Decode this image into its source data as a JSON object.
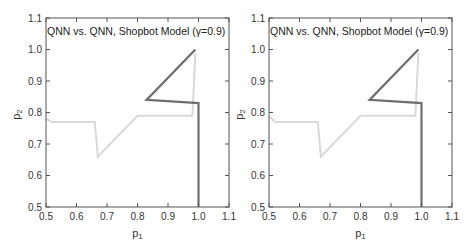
{
  "chart_data": [
    {
      "type": "line",
      "title": "QNN vs. QNN, Shopbot Model (γ=0.9)",
      "xlabel": "p1",
      "ylabel": "p2",
      "xlim": [
        0.5,
        1.1
      ],
      "ylim": [
        0.5,
        1.1
      ],
      "xticks": [
        "0.5",
        "0.6",
        "0.7",
        "0.8",
        "0.9",
        "1.0",
        "1.1"
      ],
      "yticks": [
        "0.5",
        "0.6",
        "0.7",
        "0.8",
        "0.9",
        "1.0",
        "1.1"
      ],
      "grid": false,
      "legend": null,
      "series": [
        {
          "name": "dark trajectory",
          "color": "#6e6e6e",
          "points": [
            [
              1.0,
              0.5
            ],
            [
              1.0,
              0.83
            ],
            [
              0.83,
              0.84
            ],
            [
              0.99,
              1.0
            ]
          ]
        },
        {
          "name": "light trajectory",
          "color": "#d9d9d9",
          "points": [
            [
              0.5,
              0.78
            ],
            [
              0.52,
              0.77
            ],
            [
              0.66,
              0.77
            ],
            [
              0.67,
              0.66
            ],
            [
              0.8,
              0.79
            ],
            [
              0.98,
              0.79
            ],
            [
              0.99,
              0.99
            ]
          ]
        }
      ]
    },
    {
      "type": "line",
      "title": "QNN vs. QNN, Shopbot Model (γ=0.9)",
      "xlabel": "p1",
      "ylabel": "p2",
      "xlim": [
        0.5,
        1.1
      ],
      "ylim": [
        0.5,
        1.1
      ],
      "xticks": [
        "0.5",
        "0.6",
        "0.7",
        "0.8",
        "0.9",
        "1.0",
        "1.1"
      ],
      "yticks": [
        "0.5",
        "0.6",
        "0.7",
        "0.8",
        "0.9",
        "1.0",
        "1.1"
      ],
      "grid": false,
      "legend": null,
      "series": [
        {
          "name": "dark trajectory",
          "color": "#6e6e6e",
          "points": [
            [
              1.0,
              0.5
            ],
            [
              1.0,
              0.83
            ],
            [
              0.83,
              0.84
            ],
            [
              0.99,
              1.0
            ]
          ]
        },
        {
          "name": "light trajectory",
          "color": "#d9d9d9",
          "points": [
            [
              0.5,
              0.79
            ],
            [
              0.52,
              0.77
            ],
            [
              0.66,
              0.77
            ],
            [
              0.67,
              0.66
            ],
            [
              0.8,
              0.79
            ],
            [
              0.98,
              0.79
            ],
            [
              0.99,
              0.99
            ]
          ]
        }
      ]
    }
  ],
  "panels": [
    {
      "title": "QNN vs. QNN, Shopbot Model (γ=0.9)",
      "xlabel_main": "p",
      "xlabel_sub": "1",
      "ylabel_main": "p",
      "ylabel_sub": "2"
    },
    {
      "title": "QNN vs. QNN, Shopbot Model (γ=0.9)",
      "xlabel_main": "p",
      "xlabel_sub": "1",
      "ylabel_main": "p",
      "ylabel_sub": "2"
    }
  ]
}
